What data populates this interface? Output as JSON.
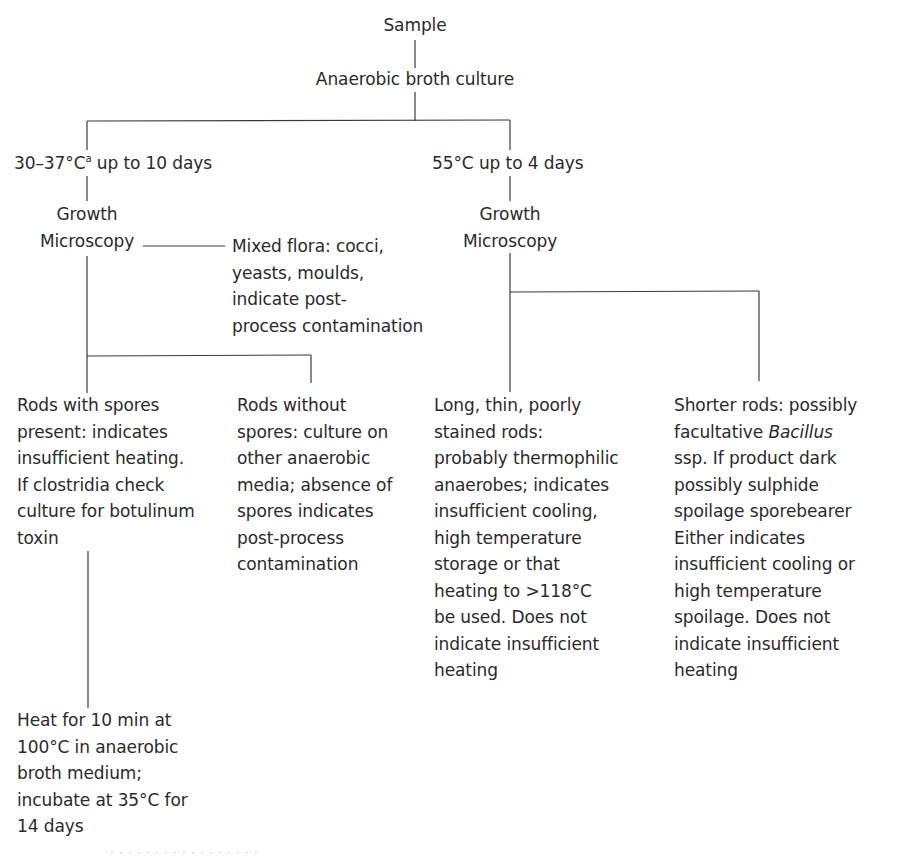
{
  "diagram": {
    "type": "flowchart",
    "root": {
      "label": "Sample"
    },
    "step1": {
      "label": "Anaerobic broth culture"
    },
    "branches": [
      {
        "id": "mesophilic",
        "condition_prefix": "30–37°C",
        "condition_superscript": "a",
        "condition_suffix": " up to 10 days",
        "growth_label": "Growth",
        "microscopy_label": "Microscopy",
        "side_result": {
          "lines": [
            "Mixed flora: cocci,",
            "yeasts, moulds,",
            "indicate post-",
            "process contamination"
          ]
        },
        "outcomes": [
          {
            "id": "rods-with-spores",
            "lines": [
              "Rods with spores",
              "present: indicates",
              "insufficient heating.",
              "If clostridia check",
              "culture for botulinum",
              "toxin"
            ],
            "follow_up": {
              "lines": [
                "Heat for 10 min at",
                "100°C in anaerobic",
                "broth medium;",
                "incubate at 35°C for",
                "14 days"
              ]
            }
          },
          {
            "id": "rods-without-spores",
            "lines": [
              "Rods without",
              "spores: culture on",
              "other anaerobic",
              "media; absence of",
              "spores indicates",
              "post-process",
              "contamination"
            ]
          }
        ]
      },
      {
        "id": "thermophilic",
        "condition_prefix": "55°C up to 4 days",
        "growth_label": "Growth",
        "microscopy_label": "Microscopy",
        "outcomes": [
          {
            "id": "long-thin-rods",
            "lines": [
              "Long, thin, poorly",
              "stained rods:",
              "probably thermophilic",
              "anaerobes; indicates",
              "insufficient cooling,",
              "high temperature",
              "storage or that",
              "heating to >118°C",
              "be used. Does not",
              "indicate insufficient",
              "heating"
            ]
          },
          {
            "id": "shorter-rods",
            "line0": "Shorter rods: possibly",
            "line1_prefix": "facultative ",
            "line1_italic": "Bacillus",
            "lines_rest": [
              "ssp. If product dark",
              "possibly sulphide",
              "spoilage sporebearer",
              "Either indicates",
              "insufficient cooling or",
              "high temperature",
              "spoilage. Does not",
              "indicate insufficient",
              "heating"
            ]
          }
        ]
      }
    ],
    "colors": {
      "text": "#2a2a2a",
      "lines": "#3a3a3a",
      "background": "#ffffff"
    },
    "caption_fragment": "· · ·   · ·   · · ·  · ·  · · · ·  · · ·"
  }
}
